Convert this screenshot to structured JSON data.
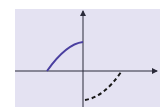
{
  "diagram": {
    "type": "function-graph",
    "background_color": "#e4e2f2",
    "axis_color": "#2a2a3a",
    "axes": {
      "x_axis": {
        "y": 71,
        "x_start": 15,
        "x_end": 157,
        "arrow": true
      },
      "y_axis": {
        "x": 83,
        "y_start": 107,
        "y_end": 11,
        "arrow": true
      }
    },
    "curves": [
      {
        "name": "solid-curve",
        "style": "solid",
        "color": "#4a3fa0",
        "description": "concave-down increasing curve from x-axis to y-axis in left half",
        "start": [
          47,
          71
        ],
        "end": [
          83,
          42
        ]
      },
      {
        "name": "dashed-curve",
        "style": "dashed",
        "color": "#1a1a1a",
        "description": "concave-up increasing curve from below origin up to x-axis in right half",
        "start": [
          85,
          100
        ],
        "end": [
          121,
          72
        ]
      }
    ]
  }
}
